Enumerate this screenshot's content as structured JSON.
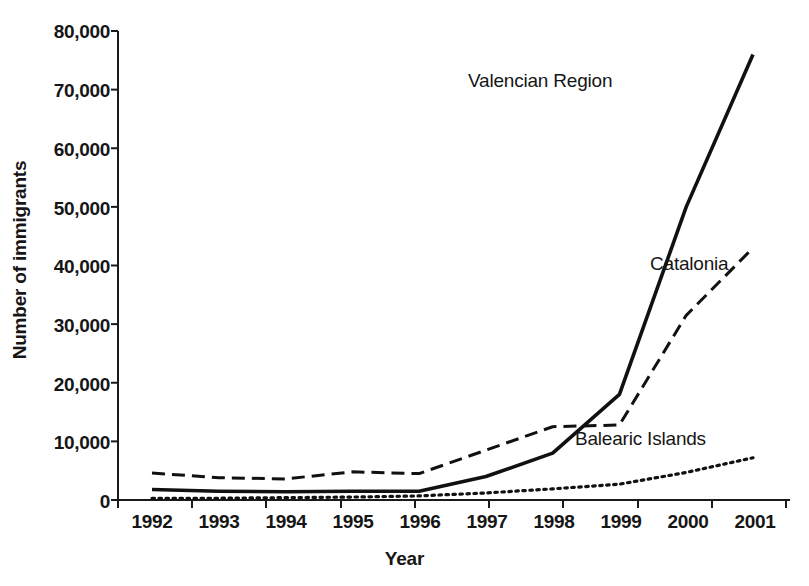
{
  "chart_data": {
    "type": "line",
    "title": "",
    "xlabel": "Year",
    "ylabel": "Number of immigrants",
    "categories": [
      "1992",
      "1993",
      "1994",
      "1995",
      "1996",
      "1997",
      "1998",
      "1999",
      "2000",
      "2001"
    ],
    "x": [
      1992,
      1993,
      1994,
      1995,
      1996,
      1997,
      1998,
      1999,
      2000,
      2001
    ],
    "xlim": [
      1992,
      2001
    ],
    "ylim": [
      0,
      80000
    ],
    "ytick_labels": [
      "0",
      "10,000",
      "20,000",
      "30,000",
      "40,000",
      "50,000",
      "60,000",
      "70,000",
      "80,000"
    ],
    "ytick_values": [
      0,
      10000,
      20000,
      30000,
      40000,
      50000,
      60000,
      70000,
      80000
    ],
    "grid": false,
    "legend_position": "inline-annotations",
    "series": [
      {
        "name": "Valencian Region",
        "style": "solid",
        "color": "#111111",
        "values": [
          1800,
          1500,
          1400,
          1500,
          1500,
          4000,
          8000,
          18000,
          50000,
          76000
        ]
      },
      {
        "name": "Catalonia",
        "style": "dashed",
        "color": "#111111",
        "values": [
          4600,
          3800,
          3600,
          4800,
          4500,
          8500,
          12500,
          12800,
          31500,
          43000
        ]
      },
      {
        "name": "Balearic Islands",
        "style": "dotted",
        "color": "#111111",
        "values": [
          300,
          300,
          400,
          500,
          700,
          1200,
          1900,
          2700,
          4700,
          7200
        ]
      }
    ],
    "annotations": [
      {
        "text": "Valencian Region",
        "series": "Valencian Region"
      },
      {
        "text": "Catalonia",
        "series": "Catalonia"
      },
      {
        "text": "Balearic Islands",
        "series": "Balearic Islands"
      }
    ]
  }
}
